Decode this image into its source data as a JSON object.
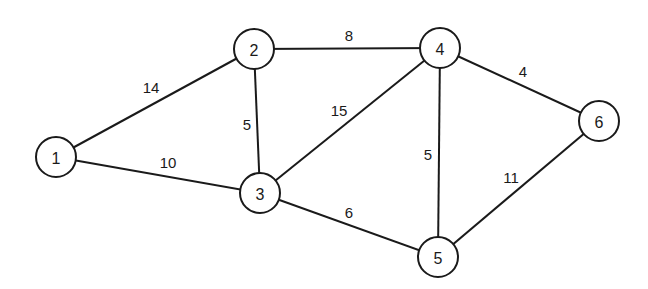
{
  "graph": {
    "type": "weighted-undirected",
    "style": {
      "stroke": "#1a1a1a",
      "background": "#ffffff",
      "node_fill": "#ffffff"
    },
    "nodes": [
      {
        "id": "1",
        "label": "1",
        "x": 56,
        "y": 157
      },
      {
        "id": "2",
        "label": "2",
        "x": 254,
        "y": 49
      },
      {
        "id": "3",
        "label": "3",
        "x": 260,
        "y": 193
      },
      {
        "id": "4",
        "label": "4",
        "x": 440,
        "y": 48
      },
      {
        "id": "5",
        "label": "5",
        "x": 438,
        "y": 257
      },
      {
        "id": "6",
        "label": "6",
        "x": 599,
        "y": 121
      }
    ],
    "edges": [
      {
        "from": "1",
        "to": "2",
        "weight": "14",
        "lx": 151,
        "ly": 87
      },
      {
        "from": "1",
        "to": "3",
        "weight": "10",
        "lx": 168,
        "ly": 162
      },
      {
        "from": "2",
        "to": "3",
        "weight": "5",
        "lx": 247,
        "ly": 124
      },
      {
        "from": "2",
        "to": "4",
        "weight": "8",
        "lx": 349,
        "ly": 35
      },
      {
        "from": "3",
        "to": "4",
        "weight": "15",
        "lx": 339,
        "ly": 110
      },
      {
        "from": "3",
        "to": "5",
        "weight": "6",
        "lx": 349,
        "ly": 212
      },
      {
        "from": "4",
        "to": "5",
        "weight": "5",
        "lx": 428,
        "ly": 154
      },
      {
        "from": "4",
        "to": "6",
        "weight": "4",
        "lx": 523,
        "ly": 71
      },
      {
        "from": "5",
        "to": "6",
        "weight": "11",
        "lx": 511,
        "ly": 177
      }
    ]
  }
}
